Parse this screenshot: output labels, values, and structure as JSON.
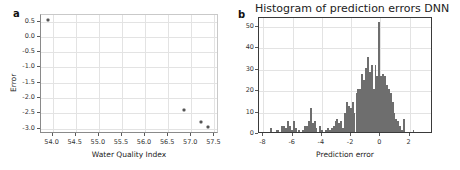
{
  "figure": {
    "background": "#ffffff",
    "marker_color": "#555555",
    "bar_color": "#6e6e6e",
    "grid_color": "#e3e3e3"
  },
  "panels": [
    {
      "letter": "a",
      "chart_ref": 0
    },
    {
      "letter": "b",
      "chart_ref": 1
    }
  ],
  "chart_data": [
    {
      "type": "scatter",
      "title": "",
      "xlabel": "Water Quality Index",
      "ylabel": "Error",
      "xlim": [
        53.75,
        57.6
      ],
      "ylim": [
        -3.18,
        0.72
      ],
      "xticks": [
        54.0,
        54.5,
        55.0,
        55.5,
        56.0,
        56.5,
        57.0,
        57.5
      ],
      "xticklabels": [
        "54.0",
        "54.5",
        "55.0",
        "55.5",
        "56.0",
        "56.5",
        "57.0",
        "57.5"
      ],
      "yticks": [
        0.5,
        0.0,
        -0.5,
        -1.0,
        -1.5,
        -2.0,
        -2.5,
        -3.0
      ],
      "yticklabels": [
        "0.5",
        "0.0",
        "-0.5",
        "-1.0",
        "-1.5",
        "-2.0",
        "-2.5",
        "-3.0"
      ],
      "grid": true,
      "legend": "none",
      "points": [
        {
          "x": 53.9,
          "y": 0.57
        },
        {
          "x": 56.85,
          "y": -2.4
        },
        {
          "x": 57.2,
          "y": -2.78
        },
        {
          "x": 57.37,
          "y": -2.95
        }
      ]
    },
    {
      "type": "bar",
      "title": "Histogram of prediction errors DNN",
      "xlabel": "Prediction error",
      "ylabel": "",
      "xlim": [
        -8.3,
        3.6
      ],
      "ylim": [
        0,
        54
      ],
      "xticks": [
        -8,
        -6,
        -4,
        -2,
        0,
        2
      ],
      "xticklabels": [
        "-8",
        "-6",
        "-4",
        "-2",
        "0",
        "2"
      ],
      "yticks": [
        0,
        10,
        20,
        30,
        40,
        50
      ],
      "yticklabels": [
        "0",
        "10",
        "20",
        "30",
        "40",
        "50"
      ],
      "grid": true,
      "legend": "none",
      "bin_width": 0.13,
      "bins": [
        -7.55,
        -7.42,
        -7.29,
        -7.16,
        -7.03,
        -6.9,
        -6.77,
        -6.64,
        -6.51,
        -6.38,
        -6.25,
        -6.12,
        -5.99,
        -5.86,
        -5.73,
        -5.6,
        -5.47,
        -5.34,
        -5.21,
        -5.08,
        -4.95,
        -4.82,
        -4.69,
        -4.56,
        -4.43,
        -4.3,
        -4.17,
        -4.04,
        -3.91,
        -3.78,
        -3.65,
        -3.52,
        -3.39,
        -3.26,
        -3.13,
        -3.0,
        -2.87,
        -2.74,
        -2.61,
        -2.48,
        -2.35,
        -2.22,
        -2.09,
        -1.96,
        -1.83,
        -1.7,
        -1.57,
        -1.44,
        -1.31,
        -1.18,
        -1.05,
        -0.92,
        -0.79,
        -0.66,
        -0.53,
        -0.4,
        -0.27,
        -0.14,
        -0.01,
        0.12,
        0.25,
        0.38,
        0.51,
        0.64,
        0.77,
        0.9,
        1.03,
        1.16,
        1.29,
        1.42,
        1.55,
        1.68,
        1.81,
        1.94,
        2.07,
        2.2,
        3.0
      ],
      "counts": [
        2,
        0,
        0,
        1,
        1,
        0,
        3,
        3,
        2,
        5,
        3,
        1,
        5,
        2,
        0,
        1,
        0,
        1,
        3,
        3,
        5,
        11,
        4,
        5,
        2,
        0,
        3,
        1,
        0,
        1,
        2,
        1,
        2,
        3,
        5,
        6,
        4,
        5,
        2,
        9,
        14,
        12,
        11,
        14,
        9,
        18,
        20,
        20,
        27,
        24,
        30,
        35,
        28,
        31,
        20,
        31,
        26,
        51,
        26,
        27,
        26,
        22,
        20,
        18,
        14,
        9,
        6,
        5,
        3,
        1,
        6,
        0,
        0,
        0,
        0,
        1
      ]
    }
  ]
}
